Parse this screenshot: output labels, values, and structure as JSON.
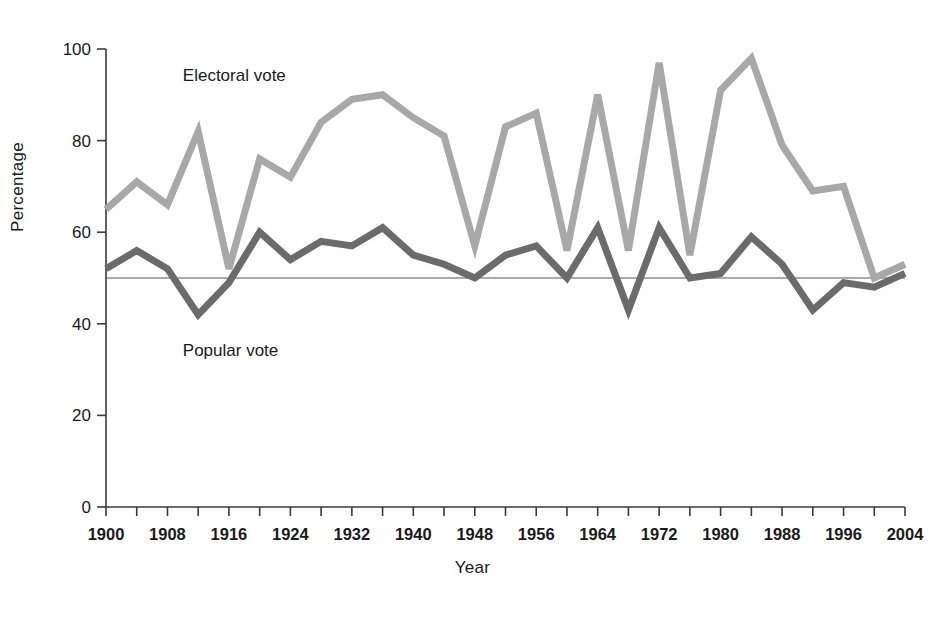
{
  "chart_data": {
    "type": "line",
    "title": "",
    "xlabel": "Year",
    "ylabel": "Percentage",
    "xlim": [
      1900,
      2004
    ],
    "ylim": [
      0,
      100
    ],
    "yticks": [
      0,
      20,
      40,
      60,
      80,
      100
    ],
    "xticks_labeled": [
      1900,
      1908,
      1916,
      1924,
      1932,
      1940,
      1948,
      1956,
      1964,
      1972,
      1980,
      1988,
      1996,
      2004
    ],
    "xticks_minor_step": 4,
    "grid": false,
    "reference_line": {
      "value": 50,
      "label": "",
      "color": "#555555"
    },
    "legend_position": "inline-annotation",
    "x": [
      1900,
      1904,
      1908,
      1912,
      1916,
      1920,
      1924,
      1928,
      1932,
      1936,
      1940,
      1944,
      1948,
      1952,
      1956,
      1960,
      1964,
      1968,
      1972,
      1976,
      1980,
      1984,
      1988,
      1992,
      1996,
      2000,
      2004
    ],
    "series": [
      {
        "name": "Electoral vote",
        "color": "#a8a8a8",
        "values": [
          65,
          71,
          66,
          82,
          52,
          76,
          72,
          84,
          89,
          90,
          85,
          81,
          57,
          83,
          86,
          56,
          90,
          56,
          97,
          55,
          91,
          98,
          79,
          69,
          70,
          50,
          53
        ]
      },
      {
        "name": "Popular vote",
        "color": "#6b6b6b",
        "values": [
          52,
          56,
          52,
          42,
          49,
          60,
          54,
          58,
          57,
          61,
          55,
          53,
          50,
          55,
          57,
          50,
          61,
          43,
          61,
          50,
          51,
          59,
          53,
          43,
          49,
          48,
          51
        ]
      }
    ],
    "annotations": [
      {
        "text": "Electoral vote",
        "x": 1910,
        "y": 93
      },
      {
        "text": "Popular vote",
        "x": 1910,
        "y": 33
      }
    ]
  }
}
